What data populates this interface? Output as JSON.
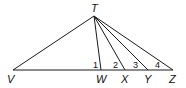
{
  "diagram": {
    "type": "geometry",
    "points": {
      "T": {
        "label": "T",
        "x": 94,
        "y": 16
      },
      "V": {
        "label": "V",
        "x": 13,
        "y": 70
      },
      "W": {
        "label": "W",
        "x": 101,
        "y": 70
      },
      "X": {
        "label": "X",
        "x": 125,
        "y": 70
      },
      "Y": {
        "label": "Y",
        "x": 148,
        "y": 70
      },
      "Z": {
        "label": "Z",
        "x": 173,
        "y": 70
      }
    },
    "segments": [
      [
        "V",
        "Z"
      ],
      [
        "T",
        "V"
      ],
      [
        "T",
        "W"
      ],
      [
        "T",
        "X"
      ],
      [
        "T",
        "Y"
      ],
      [
        "T",
        "Z"
      ]
    ],
    "angle_labels": [
      {
        "label": "1",
        "near": "W"
      },
      {
        "label": "2",
        "near": "X"
      },
      {
        "label": "3",
        "near": "Y"
      },
      {
        "label": "4",
        "near": "Z"
      }
    ]
  }
}
